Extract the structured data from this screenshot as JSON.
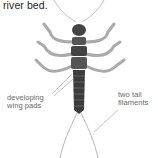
{
  "caption": {
    "text": "river bed."
  },
  "labels": {
    "wing_pads": {
      "line1": "developing",
      "line2": "wing pads"
    },
    "tail": {
      "line1": "two tail",
      "line2": "filaments"
    }
  },
  "colors": {
    "body_dark": "#3c3c3c",
    "leg": "#9a9a9a",
    "label": "#6a6a6a",
    "background": "#ffffff"
  }
}
